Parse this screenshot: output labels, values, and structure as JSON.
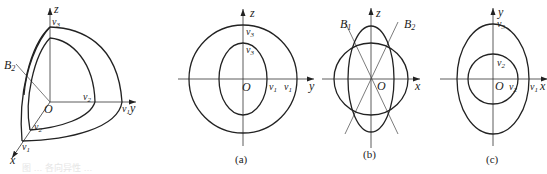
{
  "figure": {
    "caption_faint": "图 … 各向异性 …",
    "panels": [
      {
        "id": "3d",
        "axes": {
          "x": "x",
          "y": "y",
          "z": "z"
        },
        "origin": "O",
        "line_label": "B",
        "line_sub": "2",
        "labels": {
          "outer_z": {
            "base": "v",
            "sub": "3"
          },
          "inner_y": {
            "base": "v",
            "sub": "2"
          },
          "outer_y": {
            "base": "v",
            "sub": "1"
          },
          "inner_x": {
            "base": "v",
            "sub": "2"
          },
          "outer_x": {
            "base": "v",
            "sub": "1"
          }
        }
      },
      {
        "id": "a",
        "caption": "(a)",
        "axes": {
          "h": "y",
          "v": "z"
        },
        "origin": "O",
        "labels": {
          "outer_z": {
            "base": "v",
            "sub": "3"
          },
          "inner_z": {
            "base": "v",
            "sub": "3"
          },
          "inner_y": {
            "base": "v",
            "sub": "1"
          },
          "outer_y": {
            "base": "v",
            "sub": "1"
          }
        }
      },
      {
        "id": "b",
        "caption": "(b)",
        "axes": {
          "h": "x",
          "v": "z"
        },
        "origin": "O",
        "lines": [
          {
            "base": "B",
            "sub": "1"
          },
          {
            "base": "B",
            "sub": "2"
          }
        ]
      },
      {
        "id": "c",
        "caption": "(c)",
        "axes": {
          "h": "x",
          "v": "y"
        },
        "origin": "O",
        "labels": {
          "outer_y": {
            "base": "v",
            "sub": "3"
          },
          "inner_y": {
            "base": "v",
            "sub": "2"
          },
          "inner_x": {
            "base": "v",
            "sub": "2"
          },
          "outer_x": {
            "base": "v",
            "sub": "1"
          }
        }
      }
    ]
  }
}
